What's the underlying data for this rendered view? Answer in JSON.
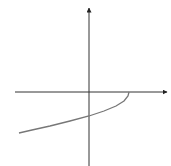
{
  "chart_data": {
    "type": "line",
    "title": "",
    "xlabel": "",
    "ylabel": "",
    "grid": false,
    "legend": null,
    "axes": {
      "origin_px": [
        89,
        92
      ],
      "x_axis": {
        "from_px": 15,
        "to_px": 167,
        "arrow": true
      },
      "y_axis": {
        "from_px": 166,
        "to_px": 8,
        "arrow": true
      }
    },
    "series": [
      {
        "name": "curve",
        "color": "#777777",
        "points_px": [
          [
            129,
            92
          ],
          [
            128,
            96
          ],
          [
            124,
            101
          ],
          [
            116,
            106
          ],
          [
            104,
            111
          ],
          [
            89,
            116
          ],
          [
            70,
            121
          ],
          [
            50,
            126
          ],
          [
            32,
            130
          ],
          [
            19,
            133
          ]
        ],
        "description": "Curve begins on the positive x-axis, turns sharply downward, crosses the negative y-axis, and continues down-left into the third quadrant (square-root-like shape)"
      }
    ]
  },
  "colors": {
    "axis": "#333333",
    "curve": "#777777",
    "background": "#ffffff"
  }
}
